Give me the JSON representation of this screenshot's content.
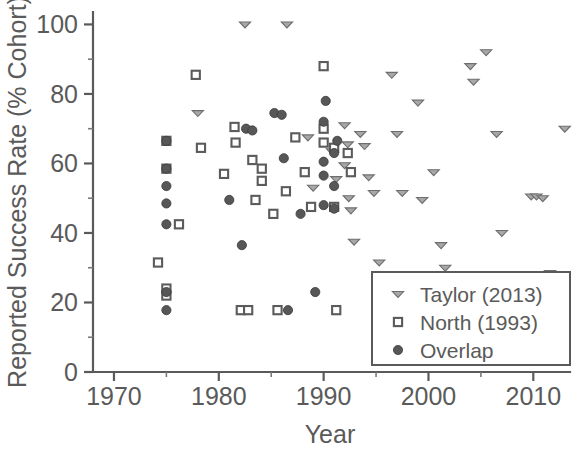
{
  "figure": {
    "title": "",
    "background_color": "#ffffff",
    "ink_color": "#5a5a5a"
  },
  "axes": {
    "x_title": "Year",
    "y_title": "Reported Success Rate (% Cohort)",
    "x_ticks": [
      "1970",
      "1980",
      "1990",
      "2000",
      "2010"
    ],
    "y_ticks": [
      "0",
      "20",
      "40",
      "60",
      "80",
      "100"
    ]
  },
  "legend": {
    "position": "bottom-right",
    "entries": [
      {
        "label": "Taylor (2013)",
        "marker": "down-triangle",
        "color": "#a8a8a8"
      },
      {
        "label": "North (1993)",
        "marker": "open-square",
        "color": "#ffffff"
      },
      {
        "label": "Overlap",
        "marker": "filled-circle",
        "color": "#575757"
      }
    ]
  },
  "chart_data": {
    "type": "scatter",
    "title": "",
    "xlabel": "Year",
    "ylabel": "Reported Success Rate (% Cohort)",
    "xlim": [
      1968,
      2013.5
    ],
    "ylim": [
      0,
      103
    ],
    "x_ticks": [
      1970,
      1980,
      1990,
      2000,
      2010
    ],
    "y_ticks": [
      0,
      20,
      40,
      60,
      80,
      100
    ],
    "x_minor_tick_step": 5,
    "y_minor_tick_step": 10,
    "grid": false,
    "legend_position": "lower right",
    "series": [
      {
        "name": "Taylor (2013)",
        "marker": "down-triangle",
        "color": "#a8a8a8",
        "points": [
          [
            1982.5,
            100.0
          ],
          [
            1986.5,
            100.0
          ],
          [
            1978.0,
            74.5
          ],
          [
            1988.5,
            67.5
          ],
          [
            1989.0,
            53.0
          ],
          [
            1990.8,
            63.5
          ],
          [
            1991.2,
            55.5
          ],
          [
            1992.0,
            71.0
          ],
          [
            1992.3,
            65.5
          ],
          [
            1992.0,
            59.5
          ],
          [
            1992.4,
            50.0
          ],
          [
            1992.6,
            46.5
          ],
          [
            1992.9,
            37.5
          ],
          [
            1993.5,
            68.5
          ],
          [
            1993.9,
            65.0
          ],
          [
            1994.3,
            56.0
          ],
          [
            1994.8,
            51.5
          ],
          [
            1995.3,
            31.5
          ],
          [
            1996.5,
            85.5
          ],
          [
            1997.0,
            68.5
          ],
          [
            1997.5,
            51.5
          ],
          [
            1999.0,
            77.5
          ],
          [
            1999.4,
            49.5
          ],
          [
            2000.5,
            57.5
          ],
          [
            2001.2,
            36.5
          ],
          [
            2001.6,
            30.0
          ],
          [
            2004.0,
            88.0
          ],
          [
            2004.3,
            83.5
          ],
          [
            2005.5,
            92.0
          ],
          [
            2006.5,
            68.5
          ],
          [
            2007.0,
            40.0
          ],
          [
            2009.8,
            50.5
          ],
          [
            2010.3,
            50.5
          ],
          [
            2010.9,
            50.0
          ],
          [
            2011.6,
            28.5
          ],
          [
            2013.0,
            70.0
          ]
        ]
      },
      {
        "name": "North (1993)",
        "marker": "open-square",
        "color": "#ffffff",
        "points": [
          [
            1974.2,
            31.5
          ],
          [
            1975.0,
            66.5
          ],
          [
            1975.0,
            58.5
          ],
          [
            1975.0,
            24.0
          ],
          [
            1975.0,
            22.0
          ],
          [
            1976.2,
            42.5
          ],
          [
            1977.8,
            85.5
          ],
          [
            1978.3,
            64.5
          ],
          [
            1980.5,
            57.0
          ],
          [
            1981.5,
            70.5
          ],
          [
            1981.6,
            66.0
          ],
          [
            1982.1,
            17.8
          ],
          [
            1982.8,
            17.8
          ],
          [
            1983.2,
            61.0
          ],
          [
            1983.5,
            49.5
          ],
          [
            1984.1,
            58.5
          ],
          [
            1984.1,
            55.0
          ],
          [
            1985.2,
            45.5
          ],
          [
            1985.6,
            17.8
          ],
          [
            1986.4,
            52.0
          ],
          [
            1987.3,
            67.5
          ],
          [
            1988.2,
            57.5
          ],
          [
            1988.8,
            47.5
          ],
          [
            1990.0,
            88.0
          ],
          [
            1990.0,
            70.0
          ],
          [
            1990.0,
            66.0
          ],
          [
            1991.0,
            64.5
          ],
          [
            1991.0,
            47.5
          ],
          [
            1991.2,
            17.8
          ],
          [
            1992.3,
            63.0
          ],
          [
            1992.6,
            57.5
          ]
        ]
      },
      {
        "name": "Overlap",
        "marker": "filled-circle",
        "color": "#575757",
        "points": [
          [
            1975.0,
            66.5
          ],
          [
            1975.0,
            58.5
          ],
          [
            1975.0,
            53.5
          ],
          [
            1975.0,
            48.5
          ],
          [
            1975.0,
            42.5
          ],
          [
            1975.0,
            23.0
          ],
          [
            1975.0,
            17.8
          ],
          [
            1981.0,
            49.5
          ],
          [
            1982.2,
            36.5
          ],
          [
            1982.6,
            70.0
          ],
          [
            1983.2,
            69.5
          ],
          [
            1985.3,
            74.5
          ],
          [
            1986.0,
            74.0
          ],
          [
            1986.2,
            61.5
          ],
          [
            1986.6,
            17.8
          ],
          [
            1987.8,
            45.5
          ],
          [
            1989.2,
            23.0
          ],
          [
            1990.0,
            72.0
          ],
          [
            1990.0,
            60.5
          ],
          [
            1990.2,
            78.0
          ],
          [
            1990.0,
            56.5
          ],
          [
            1990.0,
            48.0
          ],
          [
            1991.0,
            63.0
          ],
          [
            1991.0,
            53.5
          ],
          [
            1991.0,
            47.0
          ],
          [
            1991.3,
            66.5
          ]
        ]
      }
    ]
  }
}
